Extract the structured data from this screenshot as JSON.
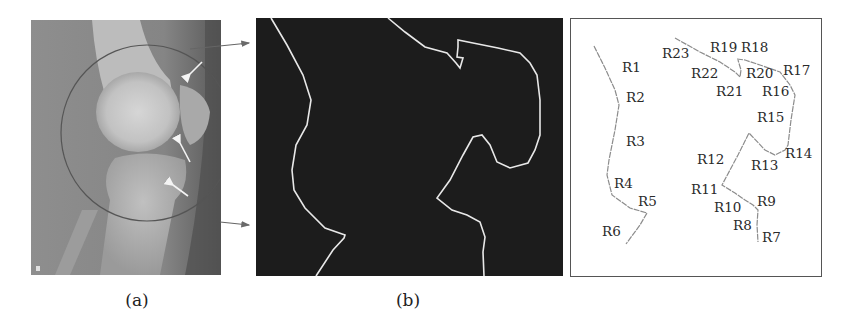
{
  "figure": {
    "panels": [
      {
        "id": "a",
        "caption": "(a)",
        "description": "Lateral knee X-ray with circled region of interest and white arrows",
        "corner_mark": "B"
      },
      {
        "id": "b",
        "caption": "(b)",
        "description": "Binary edge map showing extracted bone contours (white on black)"
      },
      {
        "id": "c",
        "caption": "",
        "description": "Contour segmented into labeled regions R1-R23",
        "region_labels": [
          {
            "text": "R1",
            "x": 622,
            "y": 72
          },
          {
            "text": "R2",
            "x": 626,
            "y": 102
          },
          {
            "text": "R3",
            "x": 626,
            "y": 146
          },
          {
            "text": "R4",
            "x": 614,
            "y": 188
          },
          {
            "text": "R5",
            "x": 638,
            "y": 206
          },
          {
            "text": "R6",
            "x": 602,
            "y": 236
          },
          {
            "text": "R7",
            "x": 762,
            "y": 242
          },
          {
            "text": "R8",
            "x": 733,
            "y": 230
          },
          {
            "text": "R9",
            "x": 757,
            "y": 206
          },
          {
            "text": "R10",
            "x": 714,
            "y": 212
          },
          {
            "text": "R11",
            "x": 691,
            "y": 194
          },
          {
            "text": "R12",
            "x": 697,
            "y": 164
          },
          {
            "text": "R13",
            "x": 751,
            "y": 170
          },
          {
            "text": "R14",
            "x": 785,
            "y": 158
          },
          {
            "text": "R15",
            "x": 757,
            "y": 122
          },
          {
            "text": "R16",
            "x": 762,
            "y": 96
          },
          {
            "text": "R17",
            "x": 783,
            "y": 75
          },
          {
            "text": "R18",
            "x": 741,
            "y": 52
          },
          {
            "text": "R19",
            "x": 710,
            "y": 52
          },
          {
            "text": "R20",
            "x": 746,
            "y": 78
          },
          {
            "text": "R21",
            "x": 716,
            "y": 96
          },
          {
            "text": "R22",
            "x": 691,
            "y": 78
          },
          {
            "text": "R23",
            "x": 662,
            "y": 58
          }
        ]
      }
    ],
    "colors": {
      "edge_background": "#1c1c1c",
      "edge_line": "#e8e8e8",
      "xray_mid": "#8a8a8a",
      "segment_line": "#8c8c8c",
      "label_text": "#2a2a2a",
      "arrow": "#707070"
    }
  }
}
